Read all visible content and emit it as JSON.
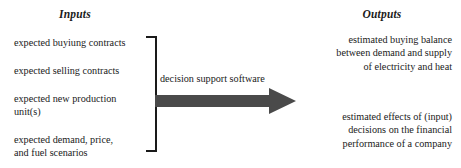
{
  "diagram": {
    "title_left": "Inputs",
    "title_right": "Outputs",
    "arrow_label": "decision support software",
    "arrow_color": "#4a4a4a",
    "line_color": "#1a1a1a",
    "background_color": "#ffffff",
    "inputs": [
      {
        "lines": [
          "expected buyiung contracts"
        ]
      },
      {
        "lines": [
          "expected selling contracts"
        ]
      },
      {
        "lines": [
          "expected new production",
          "unit(s)"
        ]
      },
      {
        "lines": [
          "expected demand, price,",
          "and fuel scenarios"
        ]
      }
    ],
    "outputs": [
      {
        "lines": [
          "estimated buying balance",
          "between demand and supply",
          "of electricity and heat"
        ]
      },
      {
        "lines": [
          "estimated effects of (input)",
          "decisions on the financial",
          "performance of a company"
        ]
      }
    ]
  }
}
